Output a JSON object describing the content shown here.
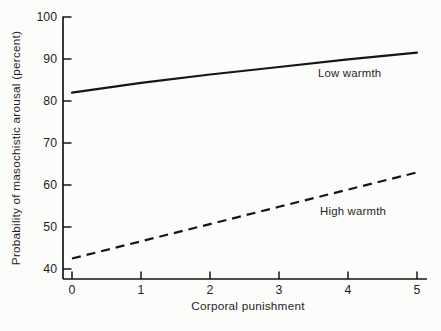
{
  "figure": {
    "background": "#fcfcfa",
    "ink_color": "#1c1c1c"
  },
  "chart_data": {
    "type": "line",
    "title": "",
    "xlabel": "Corporal punishment",
    "ylabel": "Probability of masochistic arousal (percent)",
    "xlim": [
      0,
      5
    ],
    "ylim": [
      40,
      100
    ],
    "grid": false,
    "legend": "inline-labels-next-to-lines",
    "line_color": "#161616",
    "x": [
      0,
      1,
      2,
      3,
      4,
      5
    ],
    "series": [
      {
        "name": "Low warmth",
        "style": "solid",
        "values": [
          82,
          84.3,
          86.3,
          88.1,
          89.9,
          91.5
        ]
      },
      {
        "name": "High warmth",
        "style": "dashed",
        "values": [
          42.5,
          46.6,
          50.7,
          54.8,
          58.9,
          63
        ]
      }
    ],
    "xtick_labels": [
      "0",
      "1",
      "2",
      "3",
      "4",
      "5"
    ],
    "ytick_labels": [
      "100",
      "90",
      "80",
      "70",
      "60",
      "50",
      "40"
    ]
  }
}
